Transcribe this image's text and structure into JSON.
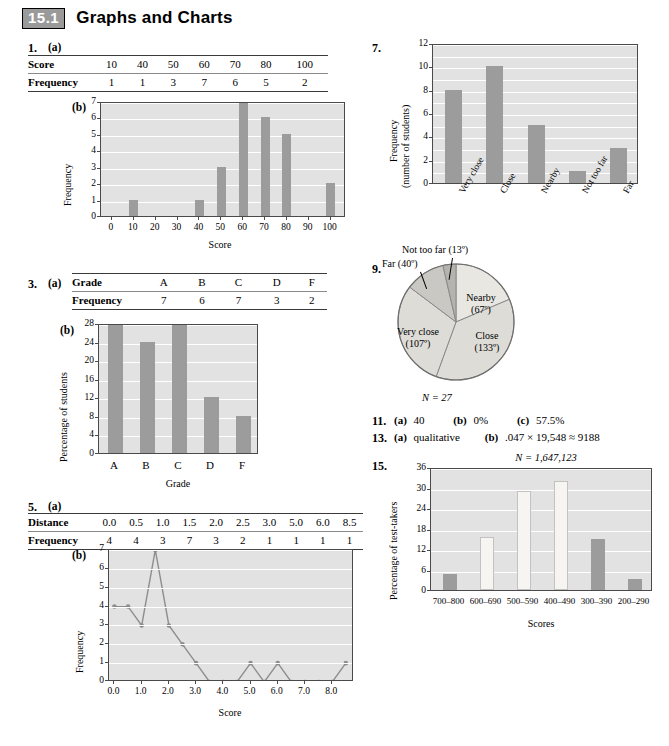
{
  "header": {
    "section_number": "15.1",
    "title": "Graphs and Charts"
  },
  "problems": {
    "p1": {
      "number": "1.",
      "part_a": "(a)",
      "part_b": "(b)",
      "table": {
        "row1_label": "Score",
        "row2_label": "Frequency",
        "scores": [
          "10",
          "40",
          "50",
          "60",
          "70",
          "80",
          "100"
        ],
        "frequencies": [
          "1",
          "1",
          "3",
          "7",
          "6",
          "5",
          "2"
        ]
      }
    },
    "p3": {
      "number": "3.",
      "part_a": "(a)",
      "part_b": "(b)",
      "table": {
        "row1_label": "Grade",
        "row2_label": "Frequency",
        "grades": [
          "A",
          "B",
          "C",
          "D",
          "F"
        ],
        "frequencies": [
          "7",
          "6",
          "7",
          "3",
          "2"
        ]
      }
    },
    "p5": {
      "number": "5.",
      "part_a": "(a)",
      "part_b": "(b)",
      "table": {
        "row1_label": "Distance",
        "row2_label": "Frequency",
        "distances": [
          "0.0",
          "0.5",
          "1.0",
          "1.5",
          "2.0",
          "2.5",
          "3.0",
          "5.0",
          "6.0",
          "8.5"
        ],
        "frequencies": [
          "4",
          "4",
          "3",
          "7",
          "3",
          "2",
          "1",
          "1",
          "1",
          "1"
        ]
      }
    },
    "p7": {
      "number": "7."
    },
    "p9": {
      "number": "9.",
      "n_label": "N = 27"
    },
    "p11": {
      "number": "11.",
      "a_tag": "(a)",
      "a_val": "40",
      "b_tag": "(b)",
      "b_val": "0%",
      "c_tag": "(c)",
      "c_val": "57.5%"
    },
    "p13": {
      "number": "13.",
      "a_tag": "(a)",
      "a_val": "qualitative",
      "b_tag": "(b)",
      "b_val": ".047 × 19,548 ≈ 9188"
    },
    "p15": {
      "number": "15.",
      "n_label": "N = 1,647,123"
    }
  },
  "chart_data": [
    {
      "id": "chart-1b",
      "type": "bar",
      "title": "",
      "xlabel": "Score",
      "ylabel": "Frequency",
      "categories": [
        10,
        40,
        50,
        60,
        70,
        80,
        100
      ],
      "values": [
        1,
        1,
        3,
        7,
        6,
        5,
        2
      ],
      "xticks": [
        "0",
        "10",
        "20",
        "30",
        "40",
        "50",
        "60",
        "70",
        "80",
        "90",
        "100"
      ],
      "xtick_values": [
        0,
        10,
        20,
        30,
        40,
        50,
        60,
        70,
        80,
        90,
        100
      ],
      "yticks": [
        "0",
        "1",
        "2",
        "3",
        "4",
        "5",
        "6",
        "7"
      ],
      "xlim": [
        -5,
        107
      ],
      "ylim": [
        0,
        7
      ],
      "grid": true
    },
    {
      "id": "chart-3b",
      "type": "bar",
      "title": "",
      "xlabel": "Grade",
      "ylabel": "Percentage of students",
      "categories": [
        "A",
        "B",
        "C",
        "D",
        "F"
      ],
      "values": [
        28,
        24,
        28,
        12,
        8
      ],
      "yticks": [
        "0",
        "4",
        "8",
        "12",
        "16",
        "20",
        "24",
        "28"
      ],
      "ylim": [
        0,
        28
      ],
      "grid": true
    },
    {
      "id": "chart-5b",
      "type": "line",
      "title": "",
      "xlabel": "Score",
      "ylabel": "Frequency",
      "x": [
        0.0,
        0.5,
        1.0,
        1.5,
        2.0,
        2.5,
        3.0,
        3.5,
        4.0,
        4.5,
        5.0,
        5.5,
        6.0,
        6.5,
        7.0,
        7.5,
        8.0,
        8.5
      ],
      "values": [
        4,
        4,
        3,
        7,
        3,
        2,
        1,
        0,
        0,
        0,
        1,
        0,
        1,
        0,
        0,
        0,
        0,
        1
      ],
      "xticks": [
        "0.0",
        "1.0",
        "2.0",
        "3.0",
        "4.0",
        "5.0",
        "6.0",
        "7.0",
        "8.0"
      ],
      "xtick_values": [
        0,
        1,
        2,
        3,
        4,
        5,
        6,
        7,
        8
      ],
      "yticks": [
        "0",
        "1",
        "2",
        "3",
        "4",
        "5",
        "6",
        "7"
      ],
      "xlim": [
        -0.2,
        8.8
      ],
      "ylim": [
        0,
        7
      ],
      "grid": true
    },
    {
      "id": "chart-7",
      "type": "bar",
      "title": "",
      "xlabel": "",
      "ylabel": "Frequency\n(number of students)",
      "ylabel_line1": "Frequency",
      "ylabel_line2": "(number of students)",
      "categories": [
        "Very close",
        "Close",
        "Nearby",
        "Not too far",
        "Far"
      ],
      "values": [
        8,
        10,
        5,
        1,
        3
      ],
      "yticks": [
        "0",
        "2",
        "4",
        "6",
        "8",
        "10",
        "12"
      ],
      "ylim": [
        0,
        12
      ],
      "grid": true
    },
    {
      "id": "chart-9",
      "type": "pie",
      "title": "",
      "n_label": "N = 27",
      "labels": [
        "Nearby",
        "Close",
        "Very close",
        "Far",
        "Not too far"
      ],
      "label_lines": [
        [
          "Nearby",
          "(67º)"
        ],
        [
          "Close",
          "(133º)"
        ],
        [
          "Very close",
          "(107º)"
        ],
        [
          "Far (40º)"
        ],
        [
          "Not too far (13º)"
        ]
      ],
      "degrees": [
        67,
        133,
        107,
        40,
        13
      ],
      "slice_colors": [
        "#e8e7e2",
        "#dddcd7",
        "#dddcd7",
        "#c9c8c3",
        "#b4b3ae"
      ]
    },
    {
      "id": "chart-15",
      "type": "bar",
      "title": "N = 1,647,123",
      "xlabel": "Scores",
      "ylabel": "Percentage of test-takers",
      "categories": [
        "700–800",
        "600–690",
        "500–590",
        "400–490",
        "300–390",
        "200–290"
      ],
      "values": [
        4.7,
        15.5,
        29,
        32,
        15,
        3.3
      ],
      "bar_shades": [
        "dark",
        "light",
        "light",
        "light",
        "dark",
        "dark"
      ],
      "yticks": [
        "0",
        "6",
        "12",
        "18",
        "24",
        "30",
        "36"
      ],
      "ylim": [
        0,
        36
      ],
      "grid": true
    }
  ],
  "colors": {
    "plot_bg": "#e2e2e2",
    "bar_dark": "#9c9c9c",
    "bar_light": "#f6f5f1",
    "grid": "#ffffff",
    "axis": "#4a4a4a",
    "badge_bg": "#9a9a9a"
  }
}
